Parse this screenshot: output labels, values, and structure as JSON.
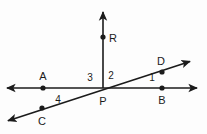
{
  "figure": {
    "kind": "geometry-diagram",
    "background_color": "#fdfdfd",
    "stroke_color": "#1b1b1b",
    "canvas": {
      "width": 207,
      "height": 134
    },
    "vertex_label": "P",
    "point_labels": {
      "a": "A",
      "b": "B",
      "c": "C",
      "d": "D",
      "r": "R",
      "p": "P"
    },
    "angle_labels": {
      "one": "1",
      "two": "2",
      "three": "3",
      "four": "4"
    },
    "lines": [
      {
        "name": "line-AB",
        "type": "double-arrow-line",
        "from": [
          4,
          88
        ],
        "to": [
          200,
          88
        ]
      },
      {
        "name": "line-CD",
        "type": "double-arrow-line",
        "from": [
          4,
          122
        ],
        "to": [
          194,
          60
        ]
      },
      {
        "name": "ray-PR",
        "type": "single-arrow-ray",
        "from": [
          103,
          88
        ],
        "to": [
          103,
          8
        ]
      }
    ],
    "points": [
      {
        "name": "point-a",
        "label": "A",
        "x": 43,
        "y": 88,
        "label_x": 43,
        "label_y": 76
      },
      {
        "name": "point-b",
        "label": "B",
        "x": 162,
        "y": 88,
        "label_x": 162,
        "label_y": 100
      },
      {
        "name": "point-c",
        "label": "C",
        "x": 42,
        "y": 108,
        "label_x": 42,
        "label_y": 121
      },
      {
        "name": "point-d",
        "label": "D",
        "x": 162,
        "y": 72,
        "label_x": 161,
        "label_y": 61
      },
      {
        "name": "point-r",
        "label": "R",
        "x": 103,
        "y": 37,
        "label_x": 113,
        "label_y": 38
      },
      {
        "name": "point-p",
        "label": "P",
        "x": 103,
        "y": 88,
        "label_x": 103,
        "label_y": 101
      }
    ]
  }
}
